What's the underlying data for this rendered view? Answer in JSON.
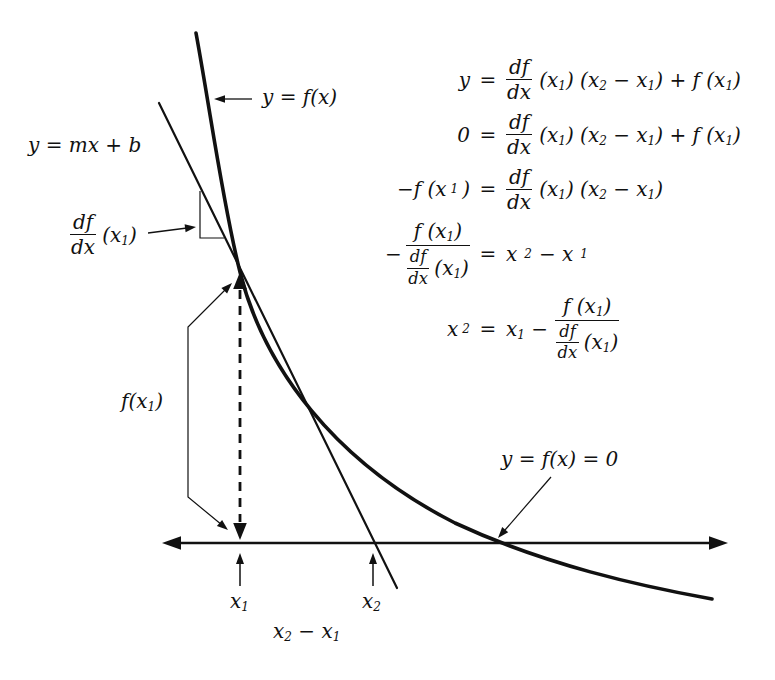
{
  "colors": {
    "ink": "#111111",
    "background": "#ffffff"
  },
  "labels": {
    "curve": "y = f(x)",
    "tangent_line": "y = mx + b",
    "slope_frac_num": "df",
    "slope_frac_den": "dx",
    "slope_rest": "(x_1)",
    "fx1": "f(x_1)",
    "root": "y = f(x) = 0",
    "x1": "x_1",
    "x2": "x_2",
    "x_diff": "x_2 − x_1"
  },
  "equations": {
    "rows": [
      {
        "lhs": "y",
        "eq": "=",
        "frac_num": "df",
        "frac_den": "dx",
        "rhs_rest": "(x_1) (x_2 − x_1) + f (x_1)"
      },
      {
        "lhs": "0",
        "eq": "=",
        "frac_num": "df",
        "frac_den": "dx",
        "rhs_rest": "(x_1) (x_2 − x_1) + f (x_1)"
      },
      {
        "lhs": "−f (x_1)",
        "eq": "=",
        "frac_num": "df",
        "frac_den": "dx",
        "rhs_rest": "(x_1) (x_2 − x_1)"
      },
      {
        "lhs_minus": "−",
        "lhs_frac_num": "f (x_1)",
        "lhs_den_frac_num": "df",
        "lhs_den_frac_den": "dx",
        "lhs_den_rest": "(x_1)",
        "eq": "=",
        "rhs": "x_2 − x_1"
      },
      {
        "lhs": "x_2",
        "eq": "=",
        "rhs_pre": "x_1 −",
        "rhs_frac_num": "f (x_1)",
        "rhs_den_frac_num": "df",
        "rhs_den_frac_den": "dx",
        "rhs_den_rest": "(x_1)"
      }
    ]
  }
}
